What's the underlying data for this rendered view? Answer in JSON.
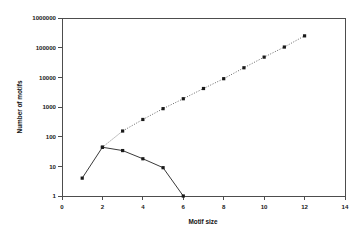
{
  "chart_data": {
    "type": "line",
    "title": "",
    "xlabel": "Motif size",
    "ylabel": "Number of motifs",
    "xlim": [
      0,
      14
    ],
    "ylim": [
      1,
      1000000
    ],
    "yscale": "log",
    "xscale": "linear",
    "grid": false,
    "legend": null,
    "xticks": [
      0,
      2,
      4,
      6,
      8,
      10,
      12,
      14
    ],
    "xtick_labels": [
      "0",
      "2",
      "4",
      "6",
      "8",
      "10",
      "12",
      "14"
    ],
    "yticks": [
      1,
      10,
      100,
      1000,
      10000,
      100000,
      1000000
    ],
    "ytick_labels": [
      "1",
      "10",
      "100",
      "1000",
      "10000",
      "100000",
      "1000000"
    ],
    "series": [
      {
        "name": "dotted-upper-series",
        "style": "dotted",
        "marker": "square",
        "x": [
          2,
          3,
          4,
          5,
          6,
          7,
          8,
          9,
          10,
          11,
          12
        ],
        "values": [
          44,
          155,
          380,
          880,
          1900,
          4200,
          9000,
          21000,
          48000,
          105000,
          250000
        ]
      },
      {
        "name": "solid-lower-series",
        "style": "solid",
        "marker": "square",
        "x": [
          1,
          2,
          3,
          4,
          5,
          6
        ],
        "values": [
          4,
          44,
          34,
          18,
          9,
          1
        ]
      }
    ]
  },
  "colors": {
    "background": "#ffffff",
    "axis": "#4d4d4d",
    "solid_series": "#222222",
    "dotted_series": "#555555",
    "marker": "#1a1a1a",
    "text": "#111111"
  },
  "axes": {
    "x_title": "Motif size",
    "y_title": "Number of motifs"
  }
}
